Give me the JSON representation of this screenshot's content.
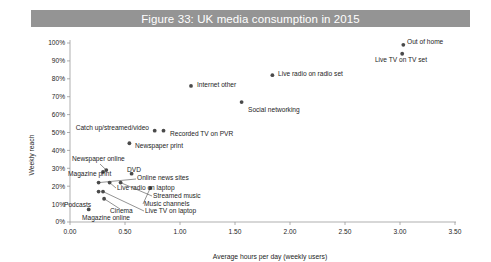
{
  "figure": {
    "title": "Figure 33: UK media consumption in 2015",
    "title_bar_color": "#949494",
    "title_text_color": "#ffffff",
    "background": "#ffffff"
  },
  "chart_data": {
    "type": "scatter",
    "title": "Figure 33: UK media consumption in 2015",
    "xlabel": "Average hours per day (weekly users)",
    "ylabel": "Weekly reach",
    "xlim": [
      0.0,
      3.5
    ],
    "ylim": [
      0,
      100
    ],
    "xticks": [
      "0.00",
      "0.50",
      "1.00",
      "1.50",
      "2.00",
      "2.50",
      "3.00",
      "3.50"
    ],
    "xtick_values": [
      0.0,
      0.5,
      1.0,
      1.5,
      2.0,
      2.5,
      3.0,
      3.5
    ],
    "yticks": [
      "0%",
      "10%",
      "20%",
      "30%",
      "40%",
      "50%",
      "60%",
      "70%",
      "80%",
      "90%",
      "100%"
    ],
    "ytick_values": [
      0,
      10,
      20,
      30,
      40,
      50,
      60,
      70,
      80,
      90,
      100
    ],
    "grid": false,
    "legend": "none",
    "marker_color": "#4a4a4a",
    "points": [
      {
        "label": "Out of home",
        "x": 3.03,
        "y": 99
      },
      {
        "label": "Live TV on TV set",
        "x": 3.02,
        "y": 94
      },
      {
        "label": "Live radio on radio set",
        "x": 1.84,
        "y": 82
      },
      {
        "label": "Internet other",
        "x": 1.1,
        "y": 76
      },
      {
        "label": "Social networking",
        "x": 1.56,
        "y": 67
      },
      {
        "label": "Catch up/streamed/video",
        "x": 0.77,
        "y": 51
      },
      {
        "label": "Recorded TV on PVR",
        "x": 0.85,
        "y": 51
      },
      {
        "label": "Newspaper print",
        "x": 0.54,
        "y": 44
      },
      {
        "label": "Newspaper online",
        "x": 0.33,
        "y": 29
      },
      {
        "label": "Magazine print",
        "x": 0.3,
        "y": 28
      },
      {
        "label": "DVD",
        "x": 0.56,
        "y": 27
      },
      {
        "label": "Online news sites",
        "x": 0.26,
        "y": 22
      },
      {
        "label": "Live radio on laptop",
        "x": 0.36,
        "y": 22
      },
      {
        "label": "Streamed music",
        "x": 0.46,
        "y": 22
      },
      {
        "label": "Music channels",
        "x": 0.73,
        "y": 19
      },
      {
        "label": "Live TV on laptop",
        "x": 0.3,
        "y": 17
      },
      {
        "label": "Podcasts",
        "x": 0.26,
        "y": 17
      },
      {
        "label": "Cinema",
        "x": 0.31,
        "y": 13
      },
      {
        "label": "Magazine online",
        "x": 0.17,
        "y": 7
      }
    ],
    "labels": [
      {
        "name": "out-of-home",
        "text": "Out of home",
        "px": 407,
        "py": 44,
        "anchor": "start"
      },
      {
        "name": "live-tv-on-tv-set",
        "text": "Live TV on TV set",
        "px": 401,
        "py": 62,
        "anchor": "middle"
      },
      {
        "name": "live-radio-on-radio-set",
        "text": "Live radio on radio set",
        "px": 278,
        "py": 76,
        "anchor": "start"
      },
      {
        "name": "internet-other",
        "text": "Internet other",
        "px": 197,
        "py": 87,
        "anchor": "start"
      },
      {
        "name": "social-networking",
        "text": "Social networking",
        "px": 248,
        "py": 112,
        "anchor": "start"
      },
      {
        "name": "catch-up-streamed-video",
        "text": "Catch up/streamed/video",
        "px": 149,
        "py": 130,
        "anchor": "end"
      },
      {
        "name": "recorded-tv-on-pvr",
        "text": "Recorded TV on PVR",
        "px": 170,
        "py": 136,
        "anchor": "start"
      },
      {
        "name": "newspaper-print",
        "text": "Newspaper print",
        "px": 135,
        "py": 148,
        "anchor": "start"
      },
      {
        "name": "newspaper-online",
        "text": "Newspaper online",
        "px": 72,
        "py": 161,
        "anchor": "start"
      },
      {
        "name": "magazine-print",
        "text": "Magazine print",
        "px": 68,
        "py": 176,
        "anchor": "start"
      },
      {
        "name": "dvd",
        "text": "DVD",
        "px": 127,
        "py": 172,
        "anchor": "start"
      },
      {
        "name": "online-news-sites",
        "text": "Online news sites",
        "px": 137,
        "py": 180,
        "anchor": "start"
      },
      {
        "name": "live-radio-on-laptop",
        "text": "Live radio on laptop",
        "px": 117,
        "py": 190,
        "anchor": "start"
      },
      {
        "name": "streamed-music",
        "text": "Streamed music",
        "px": 153,
        "py": 198,
        "anchor": "start"
      },
      {
        "name": "music-channels",
        "text": "Music channels",
        "px": 144,
        "py": 206,
        "anchor": "start"
      },
      {
        "name": "live-tv-on-laptop",
        "text": "Live TV on laptop",
        "px": 145,
        "py": 213,
        "anchor": "start"
      },
      {
        "name": "podcasts",
        "text": "Podcasts",
        "px": 64,
        "py": 207,
        "anchor": "start"
      },
      {
        "name": "cinema",
        "text": "Cinema",
        "px": 110,
        "py": 213,
        "anchor": "start"
      },
      {
        "name": "magazine-online",
        "text": "Magazine online",
        "px": 82,
        "py": 220,
        "anchor": "start"
      }
    ]
  }
}
